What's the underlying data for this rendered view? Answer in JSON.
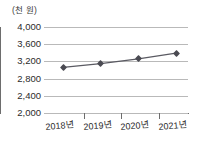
{
  "chart_data": {
    "type": "line",
    "title": "",
    "subtitle": "",
    "xlabel": "",
    "ylabel": "",
    "unit_label": "(천 원)",
    "categories": [
      "2018년",
      "2019년",
      "2020년",
      "2021년"
    ],
    "values": [
      3060,
      3150,
      3260,
      3390
    ],
    "series": [
      {
        "name": "",
        "values": [
          3060,
          3150,
          3260,
          3390
        ]
      }
    ],
    "ylim": [
      2000,
      4000
    ],
    "ytick_labels": [
      "4,000",
      "3,600",
      "3,200",
      "2,800",
      "2,400",
      "2,000"
    ],
    "ytick_values": [
      4000,
      3600,
      3200,
      2800,
      2400,
      2000
    ],
    "ytick_step": 400,
    "xtick_labels": [
      "2018년",
      "2019년",
      "2020년",
      "2021년"
    ],
    "grid": true,
    "grid_axis": "y",
    "legend": false,
    "legend_position": "none",
    "marker": "diamond",
    "annotations": []
  },
  "style": {
    "line_color": "#5a5a62",
    "marker_color": "#4a4a52",
    "grid_color": "#b9b9b9",
    "axis_color": "#6d6d6d",
    "text_color": "#2b2b2b",
    "background": "#ffffff"
  }
}
